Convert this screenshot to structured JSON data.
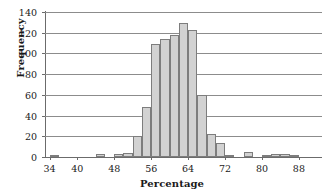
{
  "chart_data": {
    "type": "bar",
    "title": "",
    "xlabel": "Percentage",
    "ylabel": "Frequency",
    "xlim": [
      33,
      93
    ],
    "ylim": [
      0,
      140
    ],
    "grid": true,
    "legend": false,
    "bar_width": 2,
    "xtick_labels": [
      "34",
      "40",
      "48",
      "56",
      "64",
      "72",
      "80",
      "88"
    ],
    "xtick_values": [
      34,
      40,
      48,
      56,
      64,
      72,
      80,
      88
    ],
    "ytick_labels": [
      "0",
      "20",
      "40",
      "60",
      "80",
      "100",
      "120",
      "140"
    ],
    "ytick_values": [
      0,
      20,
      40,
      60,
      80,
      100,
      120,
      140
    ],
    "bin_starts": [
      34,
      36,
      38,
      40,
      42,
      44,
      46,
      48,
      50,
      52,
      54,
      56,
      58,
      60,
      62,
      64,
      66,
      68,
      70,
      72,
      74,
      76,
      78,
      80,
      82,
      84,
      86,
      88,
      90
    ],
    "categories": [
      "34",
      "36",
      "38",
      "40",
      "42",
      "44",
      "46",
      "48",
      "50",
      "52",
      "54",
      "56",
      "58",
      "60",
      "62",
      "64",
      "66",
      "68",
      "70",
      "72",
      "74",
      "76",
      "78",
      "80",
      "82",
      "84",
      "86",
      "88",
      "90"
    ],
    "values": [
      2,
      0,
      0,
      0,
      0,
      3,
      0,
      3,
      4,
      20,
      48,
      109,
      114,
      118,
      129,
      123,
      60,
      22,
      14,
      2,
      0,
      5,
      0,
      1,
      3,
      3,
      1,
      0,
      0
    ],
    "bar_fill_color": "#d2d2d2",
    "bar_border_color": "#7d7d7d",
    "gridline_color": "#8c8c8c",
    "axis_color": "#6b6b6b",
    "text_color": "#1a1a1a",
    "background_color": "#ffffff"
  }
}
